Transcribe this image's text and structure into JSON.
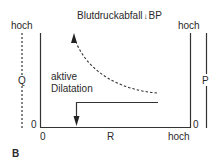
{
  "title": {
    "text": "Blutdruckabfall",
    "arrow_glyph": "↓",
    "suffix": "BP"
  },
  "left_axis": {
    "label_top": "hoch",
    "label_var": "Q",
    "label_zero": "0"
  },
  "bottom_axis": {
    "label_zero": "0",
    "label_var": "R",
    "label_high": "hoch"
  },
  "right_axis": {
    "label_top": "hoch",
    "label_var": "P",
    "label_zero": "0"
  },
  "annotation": {
    "line1": "aktive",
    "line2": "Dilatation"
  },
  "panel_label": "B",
  "colors": {
    "line": "#333333",
    "text": "#2a2a2a"
  }
}
